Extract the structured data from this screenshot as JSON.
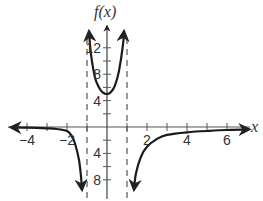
{
  "chart_data": {
    "type": "line",
    "title": "",
    "xlabel": "x",
    "ylabel": "f(x)",
    "xlim": [
      -5,
      7
    ],
    "ylim": [
      -9,
      14
    ],
    "grid": false,
    "legend": "none",
    "x_tick_labels": [
      "−4",
      "−2",
      "2",
      "4",
      "6"
    ],
    "x_tick_values": [
      -4,
      -2,
      2,
      4,
      6
    ],
    "x_minor_ticks": [
      -4,
      -3,
      -2,
      -1,
      1,
      2,
      3,
      4,
      5,
      6
    ],
    "y_tick_labels": [
      "12",
      "8",
      "4",
      "4",
      "8"
    ],
    "y_tick_values": [
      12,
      8,
      4,
      -4,
      -8
    ],
    "y_tick_note": "negative labels shown without visible minus sign",
    "y_minor_ticks": [
      -8,
      -6,
      -4,
      -2,
      2,
      4,
      6,
      8,
      10,
      12
    ],
    "vertical_asymptotes": [
      -1,
      1
    ],
    "horizontal_asymptote": 0,
    "series": [
      {
        "name": "left-branch",
        "x": [
          -4.8,
          -4,
          -3,
          -2.5,
          -2,
          -1.8,
          -1.6,
          -1.4,
          -1.3,
          -1.25
        ],
        "y": [
          -0.05,
          -0.1,
          -0.2,
          -0.3,
          -0.6,
          -1.2,
          -2.5,
          -5,
          -7.5,
          -9.5
        ]
      },
      {
        "name": "middle-branch",
        "x": [
          -0.9,
          -0.8,
          -0.6,
          -0.4,
          -0.2,
          0,
          0.2,
          0.4,
          0.6,
          0.8,
          0.85
        ],
        "y": [
          14.5,
          11,
          7.5,
          6,
          5.2,
          5,
          5.3,
          6.3,
          8.5,
          12.5,
          14.5
        ]
      },
      {
        "name": "right-branch",
        "x": [
          1.35,
          1.45,
          1.7,
          2,
          2.5,
          3,
          4,
          5,
          6,
          7.1
        ],
        "y": [
          -9.5,
          -7,
          -4.5,
          -3,
          -1.8,
          -1.2,
          -0.8,
          -0.6,
          -0.45,
          -0.35
        ]
      }
    ]
  }
}
